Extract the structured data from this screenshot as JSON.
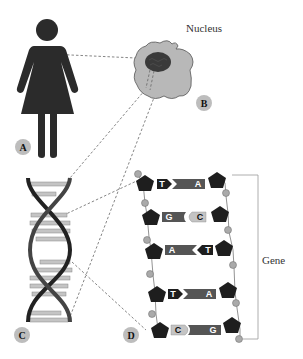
{
  "diagram": {
    "labels": {
      "nucleus": "Nucleus",
      "gene": "Gene"
    },
    "badges": [
      {
        "id": "A",
        "label": "A",
        "describes": "person"
      },
      {
        "id": "B",
        "label": "B",
        "describes": "cell nucleus"
      },
      {
        "id": "C",
        "label": "C",
        "describes": "DNA double helix"
      },
      {
        "id": "D",
        "label": "D",
        "describes": "DNA base pairs"
      }
    ],
    "base_pairs": [
      {
        "left": "T",
        "right": "A"
      },
      {
        "left": "G",
        "right": "C"
      },
      {
        "left": "A",
        "right": "T"
      },
      {
        "left": "T",
        "right": "A"
      },
      {
        "left": "C",
        "right": "G"
      }
    ],
    "colors": {
      "figure": "#2b2b2b",
      "nucleus_fill": "#b8b8b8",
      "nucleolus": "#3a3a3a",
      "badge": "#bdbdbd",
      "base_dark": "#1e1e1e",
      "base_mid": "#555555",
      "base_light": "#c4c4c4",
      "phosphate": "#aaaaaa"
    }
  }
}
